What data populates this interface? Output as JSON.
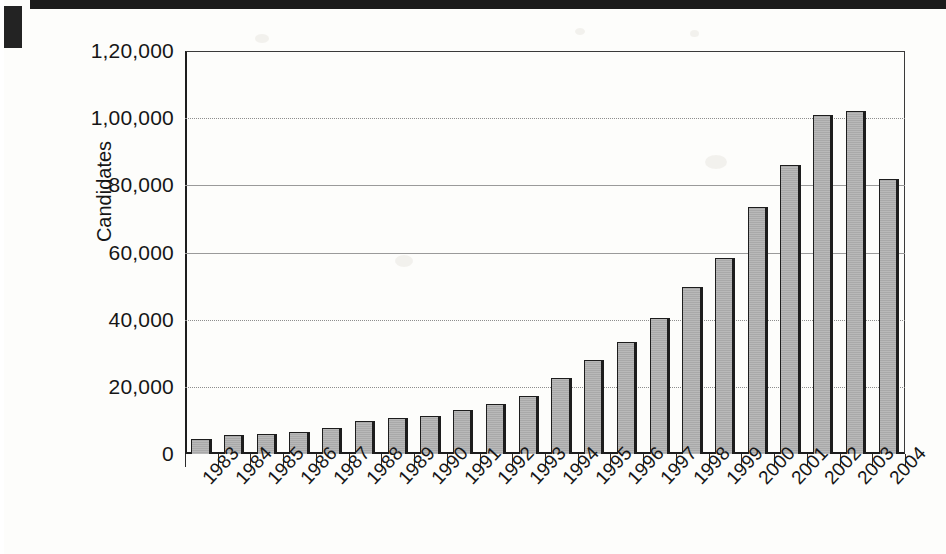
{
  "chart_data": {
    "type": "bar",
    "title": "",
    "xlabel": "",
    "ylabel": "Candidates",
    "ylim": [
      0,
      120000
    ],
    "ytick_values": [
      0,
      20000,
      40000,
      60000,
      80000,
      100000,
      120000
    ],
    "ytick_labels": [
      "0",
      "20,000",
      "40,000",
      "60,000",
      "80,000",
      "1,00,000",
      "1,20,000"
    ],
    "grid": true,
    "grid_axis": "y",
    "legend": "none",
    "categories": [
      "1983",
      "1984",
      "1985",
      "1986",
      "1987",
      "1988",
      "1989",
      "1990",
      "1991",
      "1992",
      "1993",
      "1994",
      "1995",
      "1996",
      "1997",
      "1998",
      "1999",
      "2000",
      "2001",
      "2002",
      "2003",
      "2004"
    ],
    "values": [
      4500,
      5700,
      6000,
      6700,
      7700,
      9800,
      10700,
      11200,
      13100,
      14800,
      17400,
      22600,
      28000,
      33300,
      40500,
      49800,
      58400,
      73500,
      86000,
      101000,
      102000,
      82000
    ],
    "bar_fill_color": "#b2b2b2",
    "bar_edge_color": "#1d1d1d",
    "plot_background": "#ffffff"
  },
  "axes": {
    "y_axis_title": "Candidates"
  }
}
